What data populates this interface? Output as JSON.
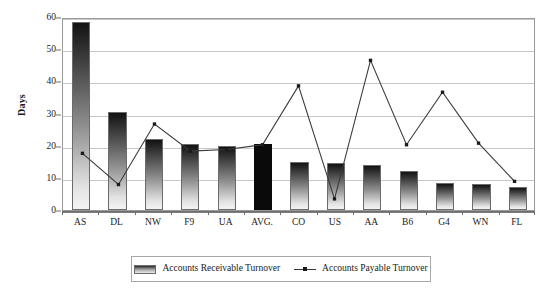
{
  "chart_data": {
    "type": "bar",
    "title": "",
    "xlabel": "",
    "ylabel": "Days",
    "ylim": [
      0,
      60
    ],
    "yticks": [
      0,
      10,
      20,
      30,
      40,
      50,
      60
    ],
    "grid": true,
    "legend_position": "bottom",
    "categories": [
      "AS",
      "DL",
      "NW",
      "F9",
      "UA",
      "AVG.",
      "CO",
      "US",
      "AA",
      "B6",
      "G4",
      "WN",
      "FL"
    ],
    "series": [
      {
        "name": "Accounts Receivable Turnover",
        "type": "bar",
        "values": [
          58.5,
          30.5,
          22.0,
          20.5,
          20.0,
          20.5,
          15.0,
          14.5,
          14.0,
          12.0,
          8.5,
          8.0,
          7.0
        ],
        "highlight_index": 5,
        "highlight_color": "#0a0a0a"
      },
      {
        "name": "Accounts Payable Turnover",
        "type": "line",
        "values": [
          17.8,
          8.0,
          27.0,
          18.5,
          19.0,
          20.5,
          39.0,
          3.5,
          47.0,
          20.5,
          37.0,
          21.0,
          9.0
        ],
        "color": "#3a3a3a",
        "marker": "square"
      }
    ]
  },
  "legend": {
    "entries": [
      {
        "label": "Accounts Receivable Turnover",
        "marker": "bar-swatch-icon"
      },
      {
        "label": "Accounts Payable Turnover",
        "marker": "line-marker-icon"
      }
    ]
  },
  "axis": {
    "y_title": "Days"
  }
}
